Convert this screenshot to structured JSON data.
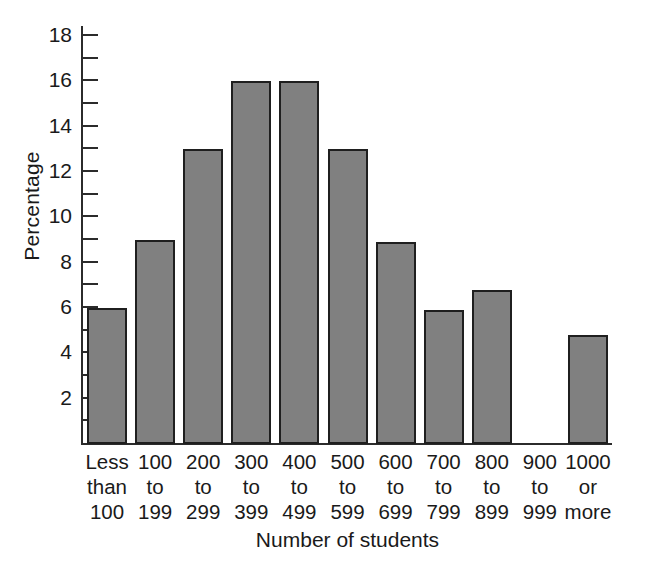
{
  "chart_data": {
    "type": "bar",
    "title": "",
    "xlabel": "Number of students",
    "ylabel": "Percentage",
    "categories": [
      "Less than 100",
      "100 to 199",
      "200 to 299",
      "300 to 399",
      "400 to 499",
      "500 to 599",
      "600 to 699",
      "700 to 799",
      "800 to 899",
      "900 to 999",
      "1000 or more"
    ],
    "category_lines": [
      [
        "Less",
        "than",
        "100"
      ],
      [
        "100",
        "to",
        "199"
      ],
      [
        "200",
        "to",
        "299"
      ],
      [
        "300",
        "to",
        "399"
      ],
      [
        "400",
        "to",
        "499"
      ],
      [
        "500",
        "to",
        "599"
      ],
      [
        "600",
        "to",
        "699"
      ],
      [
        "700",
        "to",
        "799"
      ],
      [
        "800",
        "to",
        "899"
      ],
      [
        "900",
        "to",
        "999"
      ],
      [
        "1000",
        "or",
        "more"
      ]
    ],
    "values": [
      6,
      9,
      13,
      16,
      16,
      13,
      8.9,
      5.9,
      6.8,
      0,
      4.8
    ],
    "ylim": [
      0,
      18.4
    ],
    "ytick_major": [
      2,
      4,
      6,
      8,
      10,
      12,
      14,
      16,
      18
    ],
    "ytick_minor": [
      1,
      3,
      5,
      7,
      9,
      11,
      13,
      15,
      17
    ],
    "ytick_labels": [
      "2",
      "4",
      "6",
      "8",
      "10",
      "12",
      "14",
      "16",
      "18"
    ],
    "grid": false,
    "legend": false,
    "bar_color": "#808080",
    "bar_edge_color": "#1f1f1f",
    "axis_color": "#2b2b2b",
    "background": "#ffffff"
  }
}
